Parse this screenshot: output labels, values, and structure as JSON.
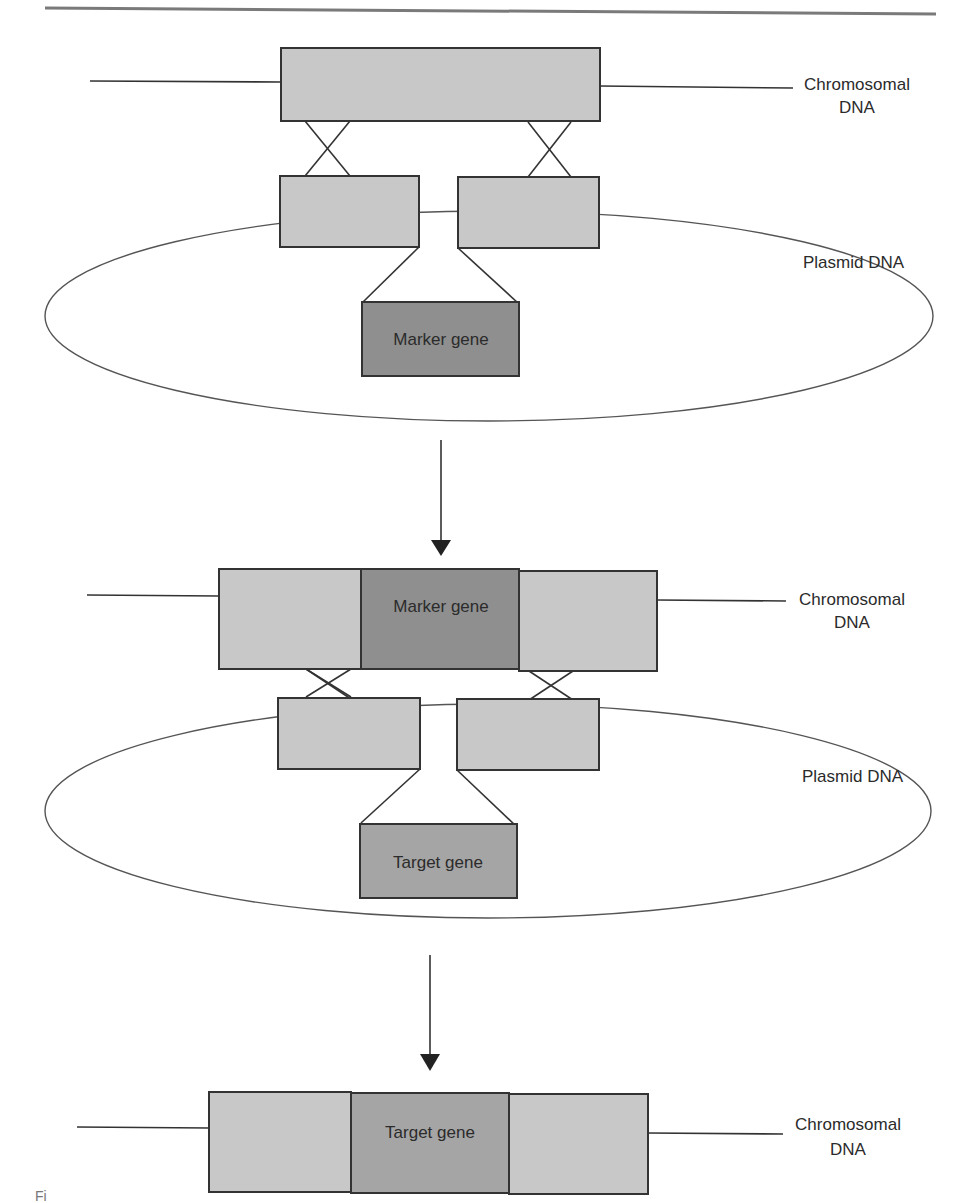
{
  "diagram": {
    "type": "gene-replacement-by-homologous-recombination",
    "colors": {
      "homology_arm": "#c8c8c8",
      "marker_gene": "#8f8f8f",
      "target_gene": "#a5a5a5",
      "stroke": "#333333",
      "rule": "#7a7a7a"
    },
    "step1": {
      "chromosome_label_line1": "Chromosomal",
      "chromosome_label_line2": "DNA",
      "plasmid_label": "Plasmid DNA",
      "insert_gene": "Marker gene"
    },
    "step2": {
      "chromosome_gene": "Marker gene",
      "chromosome_label_line1": "Chromosomal",
      "chromosome_label_line2": "DNA",
      "plasmid_label": "Plasmid DNA",
      "insert_gene": "Target gene"
    },
    "step3": {
      "chromosome_gene": "Target gene",
      "chromosome_label_line1": "Chromosomal",
      "chromosome_label_line2": "DNA"
    },
    "caption_fragment": "Fi"
  }
}
